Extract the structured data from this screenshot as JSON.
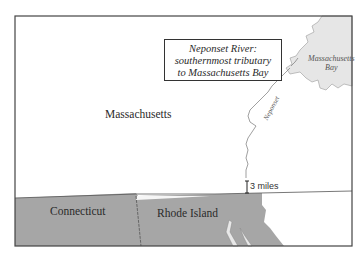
{
  "map": {
    "callout": {
      "line1": "Neponset River:",
      "line2": "southernmost tributary",
      "line3": "to Massachusetts Bay"
    },
    "labels": {
      "massachusetts": "Massachusetts",
      "connecticut": "Connecticut",
      "rhode_island": "Rhode Island",
      "bay_line1": "Massachusetts",
      "bay_line2": "Bay",
      "river": "Neponset"
    },
    "scale": {
      "label": "3 miles"
    },
    "colors": {
      "land": "#ffffff",
      "southern_states": "#a6a6a6",
      "water": "#e6e6e6",
      "border": "#444444"
    }
  }
}
